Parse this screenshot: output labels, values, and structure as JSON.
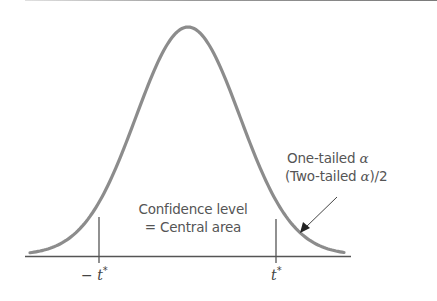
{
  "diagram": {
    "title": "",
    "type": "t-distribution confidence interval",
    "center_label_line1": "Confidence level",
    "center_label_line2": "= Central area",
    "tail_label_line1_text": "One-tailed",
    "tail_label_line1_symbol": "α",
    "tail_label_line2_prefix": "(Two-tailed",
    "tail_label_line2_symbol": "α",
    "tail_label_line2_suffix": ")/2",
    "left_tick_label": "− t",
    "left_tick_sup": "*",
    "right_tick_label": "t",
    "right_tick_sup": "*",
    "colors": {
      "curve": "#8c8c8c",
      "axis": "#555555",
      "text": "#555555"
    }
  }
}
